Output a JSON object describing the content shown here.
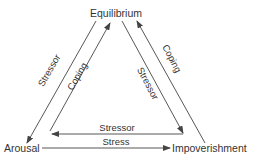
{
  "nodes": {
    "top": "Equilibrium",
    "left": "Arousal",
    "right": "Impoverishment"
  },
  "edges": {
    "equilibrium_to_arousal": "Stressor",
    "arousal_to_equilibrium": "Coping",
    "equilibrium_to_impoverishment": "Stressor",
    "impoverishment_to_equilibrium": "Coping",
    "impoverishment_to_arousal": "Stressor",
    "arousal_to_impoverishment": "Stress"
  },
  "colors": {
    "line": "#444444",
    "text": "#333333"
  }
}
